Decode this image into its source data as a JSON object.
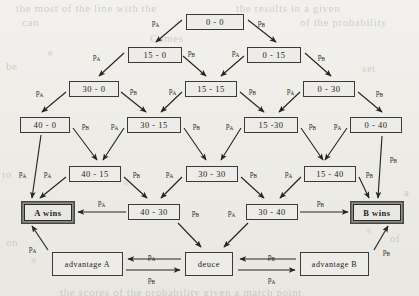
{
  "diagram": {
    "accent_color": "#3a3a38",
    "paper_color": "#efeeea",
    "ink_color": "#1d1d1b",
    "nodes": [
      {
        "id": "n00",
        "label": "0 - 0",
        "x": 186,
        "y": 14,
        "w": 58,
        "h": 16,
        "kind": "score"
      },
      {
        "id": "n150",
        "label": "15 - 0",
        "x": 128,
        "y": 47,
        "w": 54,
        "h": 16,
        "kind": "score"
      },
      {
        "id": "n015",
        "label": "0 - 15",
        "x": 247,
        "y": 47,
        "w": 54,
        "h": 16,
        "kind": "score"
      },
      {
        "id": "n300",
        "label": "30 - 0",
        "x": 69,
        "y": 81,
        "w": 50,
        "h": 16,
        "kind": "score"
      },
      {
        "id": "n1515",
        "label": "15 - 15",
        "x": 185,
        "y": 81,
        "w": 52,
        "h": 16,
        "kind": "score"
      },
      {
        "id": "n030",
        "label": "0 - 30",
        "x": 303,
        "y": 81,
        "w": 52,
        "h": 16,
        "kind": "score"
      },
      {
        "id": "n400",
        "label": "40 - 0",
        "x": 20,
        "y": 117,
        "w": 50,
        "h": 16,
        "kind": "score"
      },
      {
        "id": "n3015",
        "label": "30 - 15",
        "x": 127,
        "y": 117,
        "w": 54,
        "h": 16,
        "kind": "score"
      },
      {
        "id": "n1530",
        "label": "15 -30",
        "x": 244,
        "y": 117,
        "w": 54,
        "h": 16,
        "kind": "score"
      },
      {
        "id": "n040",
        "label": "0 - 40",
        "x": 350,
        "y": 117,
        "w": 52,
        "h": 16,
        "kind": "score"
      },
      {
        "id": "n4015",
        "label": "40 - 15",
        "x": 69,
        "y": 166,
        "w": 52,
        "h": 16,
        "kind": "score"
      },
      {
        "id": "n3030",
        "label": "30 - 30",
        "x": 186,
        "y": 166,
        "w": 52,
        "h": 16,
        "kind": "score"
      },
      {
        "id": "n1540",
        "label": "15 - 40",
        "x": 304,
        "y": 166,
        "w": 52,
        "h": 16,
        "kind": "score"
      },
      {
        "id": "awins",
        "label": "A wins",
        "x": 24,
        "y": 204,
        "w": 48,
        "h": 17,
        "kind": "win"
      },
      {
        "id": "n4030",
        "label": "40 - 30",
        "x": 128,
        "y": 204,
        "w": 52,
        "h": 16,
        "kind": "score"
      },
      {
        "id": "n3040",
        "label": "30 - 40",
        "x": 246,
        "y": 204,
        "w": 52,
        "h": 16,
        "kind": "score"
      },
      {
        "id": "bwins",
        "label": "B wins",
        "x": 353,
        "y": 204,
        "w": 48,
        "h": 17,
        "kind": "win"
      },
      {
        "id": "advA",
        "label": "advantage A",
        "x": 52,
        "y": 252,
        "w": 71,
        "h": 24,
        "kind": "state"
      },
      {
        "id": "deuce",
        "label": "deuce",
        "x": 185,
        "y": 252,
        "w": 48,
        "h": 24,
        "kind": "state"
      },
      {
        "id": "advB",
        "label": "advantage B",
        "x": 300,
        "y": 252,
        "w": 69,
        "h": 24,
        "kind": "state"
      }
    ],
    "edge_labels": [
      {
        "id": "e1",
        "p": "A",
        "x": 152,
        "y": 19
      },
      {
        "id": "e2",
        "p": "B",
        "x": 258,
        "y": 19
      },
      {
        "id": "e3",
        "p": "A",
        "x": 93,
        "y": 53
      },
      {
        "id": "e4",
        "p": "B",
        "x": 188,
        "y": 49
      },
      {
        "id": "e5",
        "p": "A",
        "x": 232,
        "y": 49
      },
      {
        "id": "e6",
        "p": "B",
        "x": 318,
        "y": 53
      },
      {
        "id": "e7",
        "p": "A",
        "x": 36,
        "y": 89
      },
      {
        "id": "e8",
        "p": "B",
        "x": 130,
        "y": 87
      },
      {
        "id": "e9",
        "p": "A",
        "x": 169,
        "y": 87
      },
      {
        "id": "e10",
        "p": "B",
        "x": 249,
        "y": 87
      },
      {
        "id": "e11",
        "p": "A",
        "x": 287,
        "y": 87
      },
      {
        "id": "e12",
        "p": "B",
        "x": 376,
        "y": 89
      },
      {
        "id": "e13",
        "p": "B",
        "x": 82,
        "y": 122
      },
      {
        "id": "e14",
        "p": "A",
        "x": 111,
        "y": 122
      },
      {
        "id": "e15",
        "p": "B",
        "x": 193,
        "y": 122
      },
      {
        "id": "e16",
        "p": "A",
        "x": 226,
        "y": 122
      },
      {
        "id": "e17",
        "p": "B",
        "x": 309,
        "y": 122
      },
      {
        "id": "e18",
        "p": "A",
        "x": 334,
        "y": 122
      },
      {
        "id": "e19",
        "p": "A",
        "x": 19,
        "y": 170
      },
      {
        "id": "e20",
        "p": "A",
        "x": 44,
        "y": 170
      },
      {
        "id": "e21",
        "p": "B",
        "x": 133,
        "y": 170
      },
      {
        "id": "e22",
        "p": "A",
        "x": 166,
        "y": 170
      },
      {
        "id": "e23",
        "p": "B",
        "x": 250,
        "y": 170
      },
      {
        "id": "e24",
        "p": "A",
        "x": 285,
        "y": 170
      },
      {
        "id": "e25",
        "p": "B",
        "x": 366,
        "y": 170
      },
      {
        "id": "e26",
        "p": "B",
        "x": 390,
        "y": 155
      },
      {
        "id": "e27",
        "p": "A",
        "x": 98,
        "y": 199
      },
      {
        "id": "e28",
        "p": "B",
        "x": 192,
        "y": 209
      },
      {
        "id": "e29",
        "p": "A",
        "x": 228,
        "y": 209
      },
      {
        "id": "e30",
        "p": "B",
        "x": 317,
        "y": 199
      },
      {
        "id": "e31",
        "p": "A",
        "x": 29,
        "y": 245
      },
      {
        "id": "e32",
        "p": "B",
        "x": 383,
        "y": 248
      },
      {
        "id": "e33",
        "p": "A",
        "x": 148,
        "y": 253
      },
      {
        "id": "e34",
        "p": "B",
        "x": 148,
        "y": 276
      },
      {
        "id": "e35",
        "p": "B",
        "x": 268,
        "y": 253
      },
      {
        "id": "e36",
        "p": "A",
        "x": 268,
        "y": 276
      }
    ],
    "edges": [
      {
        "from": "n00",
        "to": "n150",
        "p": "A"
      },
      {
        "from": "n00",
        "to": "n015",
        "p": "B"
      },
      {
        "from": "n150",
        "to": "n300",
        "p": "A"
      },
      {
        "from": "n150",
        "to": "n1515",
        "p": "B"
      },
      {
        "from": "n015",
        "to": "n1515",
        "p": "A"
      },
      {
        "from": "n015",
        "to": "n030",
        "p": "B"
      },
      {
        "from": "n300",
        "to": "n400",
        "p": "A"
      },
      {
        "from": "n300",
        "to": "n3015",
        "p": "B"
      },
      {
        "from": "n1515",
        "to": "n3015",
        "p": "A"
      },
      {
        "from": "n1515",
        "to": "n1530",
        "p": "B"
      },
      {
        "from": "n030",
        "to": "n1530",
        "p": "A"
      },
      {
        "from": "n030",
        "to": "n040",
        "p": "B"
      },
      {
        "from": "n400",
        "to": "awins",
        "p": "A"
      },
      {
        "from": "n400",
        "to": "n4015",
        "p": "B"
      },
      {
        "from": "n3015",
        "to": "n4015",
        "p": "A"
      },
      {
        "from": "n3015",
        "to": "n3030",
        "p": "B"
      },
      {
        "from": "n1530",
        "to": "n3030",
        "p": "A"
      },
      {
        "from": "n1530",
        "to": "n1540",
        "p": "B"
      },
      {
        "from": "n040",
        "to": "n1540",
        "p": "A"
      },
      {
        "from": "n040",
        "to": "bwins",
        "p": "B"
      },
      {
        "from": "n4015",
        "to": "awins",
        "p": "A"
      },
      {
        "from": "n4015",
        "to": "n4030",
        "p": "B"
      },
      {
        "from": "n3030",
        "to": "n4030",
        "p": "A"
      },
      {
        "from": "n3030",
        "to": "n3040",
        "p": "B"
      },
      {
        "from": "n1540",
        "to": "n3040",
        "p": "A"
      },
      {
        "from": "n1540",
        "to": "bwins",
        "p": "B"
      },
      {
        "from": "n4030",
        "to": "awins",
        "p": "A"
      },
      {
        "from": "n4030",
        "to": "deuce",
        "p": "B"
      },
      {
        "from": "n3040",
        "to": "deuce",
        "p": "A"
      },
      {
        "from": "n3040",
        "to": "bwins",
        "p": "B"
      },
      {
        "from": "advA",
        "to": "awins",
        "p": "A"
      },
      {
        "from": "advA",
        "to": "deuce",
        "p": "B"
      },
      {
        "from": "deuce",
        "to": "advA",
        "p": "A"
      },
      {
        "from": "deuce",
        "to": "advB",
        "p": "B"
      },
      {
        "from": "advB",
        "to": "deuce",
        "p": "A"
      },
      {
        "from": "advB",
        "to": "bwins",
        "p": "B"
      }
    ]
  }
}
